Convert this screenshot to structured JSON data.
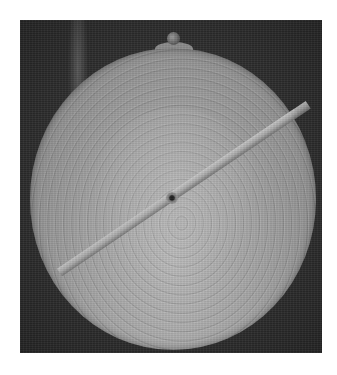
{
  "image": {
    "subject": "engraved circular disc with rotating rule",
    "palette": {
      "background": "#ffffff",
      "photo_backdrop": "#2a2a2a",
      "disc_light": "#b8b8b8",
      "disc_dark": "#7a7a7a",
      "rule": "#a9a9a9"
    }
  }
}
